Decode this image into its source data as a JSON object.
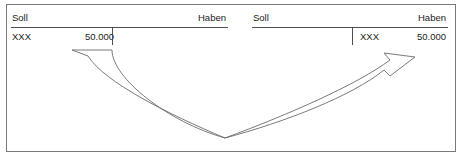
{
  "diagram": {
    "frame_color": "#7a7a7a",
    "rule_color": "#4d4d4d",
    "arrow_stroke_color": "#6b6b6b",
    "arrow_fill_color": "#ffffff",
    "text_color": "#1a1a1a"
  },
  "accounts": [
    {
      "id": "left-account",
      "headers": {
        "debit": "Soll",
        "credit": "Haben"
      },
      "rows": [
        {
          "debit_label": "XXX",
          "debit_amount": "50.000",
          "credit_label": "",
          "credit_amount": ""
        }
      ]
    },
    {
      "id": "right-account",
      "headers": {
        "debit": "Soll",
        "credit": "Haben"
      },
      "rows": [
        {
          "debit_label": "",
          "debit_amount": "",
          "credit_label": "XXX",
          "credit_amount": "50.000"
        }
      ]
    }
  ],
  "arrow": {
    "name": "transfer-arrow",
    "from": "left-account-debit-amount",
    "to": "right-account-credit-amount",
    "direction": "left-to-right"
  }
}
